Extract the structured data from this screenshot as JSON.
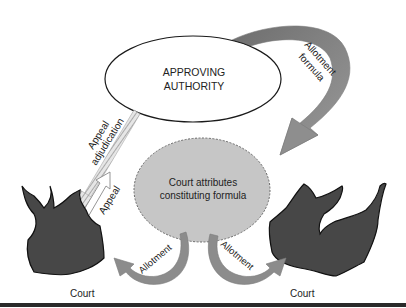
{
  "diagram": {
    "nodes": {
      "authority": {
        "line1": "APPROVING",
        "line2": "AUTHORITY"
      },
      "formula": {
        "line1": "Court attributes",
        "line2": "constituting formula"
      },
      "court_left": {
        "label": "Court"
      },
      "court_right": {
        "label": "Court"
      }
    },
    "edges": {
      "allotment_formula": {
        "line1": "Allotment",
        "line2": "formula"
      },
      "appeal_adjudication": {
        "line1": "Appeal",
        "line2": "adjudication"
      },
      "appeal": {
        "label": "Appeal"
      },
      "allotment_left": {
        "label": "Allotment"
      },
      "allotment_right": {
        "label": "Allotment"
      }
    },
    "colors": {
      "arrow_fill": "#8f8f8f",
      "arrow_dark": "#6f6f6f",
      "circle_fill": "#c9c9c9",
      "court_fill": "#4a4a4a",
      "outline": "#1a1a1a"
    }
  }
}
